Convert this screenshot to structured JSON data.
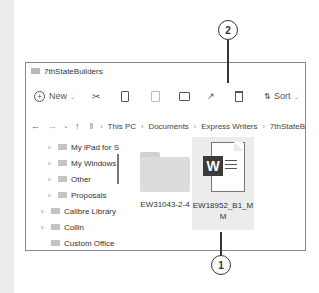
{
  "window": {
    "title": "7thStateBuilders"
  },
  "toolbar": {
    "new_label": "New",
    "sort_label": "Sort",
    "icons": [
      "new-icon",
      "cut-icon",
      "copy-icon",
      "paste-icon",
      "rename-icon",
      "share-icon",
      "delete-icon",
      "sort-icon"
    ]
  },
  "addressbar": {
    "crumbs": [
      "This PC",
      "Documents",
      "Express Writers",
      "7thStateB"
    ]
  },
  "sidebar": {
    "items": [
      {
        "label": "My iPad for S",
        "level": 2
      },
      {
        "label": "My Windows",
        "level": 2
      },
      {
        "label": "Other",
        "level": 2
      },
      {
        "label": "Proposals",
        "level": 2
      },
      {
        "label": "Calibre Library",
        "level": 1
      },
      {
        "label": "Collin",
        "level": 1
      },
      {
        "label": "Custom Office",
        "level": 1
      }
    ]
  },
  "files": [
    {
      "name": "EW31043-2-4",
      "type": "folder"
    },
    {
      "name_line1": "EW18952_B1_M",
      "name_line2": "M",
      "type": "word-document",
      "selected": true,
      "badge": "W"
    }
  ],
  "callouts": [
    {
      "number": "1"
    },
    {
      "number": "2"
    }
  ]
}
